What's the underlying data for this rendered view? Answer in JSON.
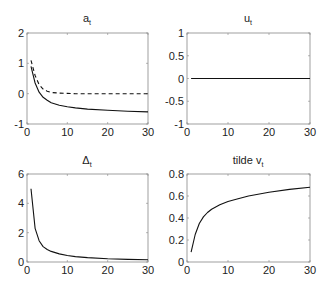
{
  "chart_data": [
    {
      "type": "line",
      "title": "a_t",
      "title_main": "a",
      "title_sub": "t",
      "xlabel": "",
      "ylabel": "",
      "xlim": [
        0,
        30
      ],
      "ylim": [
        -1,
        2
      ],
      "xticks": [
        0,
        10,
        20,
        30
      ],
      "yticks": [
        -1,
        0,
        1,
        2
      ],
      "x": [
        1,
        2,
        3,
        4,
        5,
        6,
        8,
        10,
        12,
        15,
        20,
        25,
        30
      ],
      "series": [
        {
          "name": "solid",
          "style": "solid",
          "values": [
            0.9,
            0.35,
            0.05,
            -0.12,
            -0.22,
            -0.3,
            -0.38,
            -0.43,
            -0.47,
            -0.51,
            -0.55,
            -0.58,
            -0.6
          ]
        },
        {
          "name": "dashed",
          "style": "dashed",
          "values": [
            1.1,
            0.6,
            0.3,
            0.15,
            0.08,
            0.04,
            0.02,
            0.01,
            0.0,
            0.0,
            0.0,
            0.0,
            0.0
          ]
        }
      ]
    },
    {
      "type": "line",
      "title": "u_t",
      "title_main": "u",
      "title_sub": "t",
      "xlim": [
        0,
        30
      ],
      "ylim": [
        -1,
        1
      ],
      "xticks": [
        0,
        10,
        20,
        30
      ],
      "yticks": [
        -1,
        -0.5,
        0,
        0.5,
        1
      ],
      "x": [
        1,
        30
      ],
      "series": [
        {
          "name": "solid",
          "style": "solid",
          "values": [
            0,
            0
          ]
        }
      ]
    },
    {
      "type": "line",
      "title": "Δ_t",
      "title_main": "Δ",
      "title_sub": "t",
      "xlim": [
        0,
        30
      ],
      "ylim": [
        0,
        6
      ],
      "xticks": [
        0,
        10,
        20,
        30
      ],
      "yticks": [
        0,
        2,
        4,
        6
      ],
      "x": [
        1,
        2,
        3,
        4,
        5,
        6,
        8,
        10,
        12,
        15,
        20,
        25,
        30
      ],
      "series": [
        {
          "name": "solid",
          "style": "solid",
          "values": [
            5.0,
            2.3,
            1.45,
            1.05,
            0.85,
            0.72,
            0.55,
            0.44,
            0.37,
            0.3,
            0.22,
            0.18,
            0.15
          ]
        }
      ]
    },
    {
      "type": "line",
      "title": "tilde v_t",
      "title_main": "tilde v",
      "title_sub": "t",
      "xlim": [
        0,
        30
      ],
      "ylim": [
        0,
        0.8
      ],
      "xticks": [
        0,
        10,
        20,
        30
      ],
      "yticks": [
        0,
        0.2,
        0.4,
        0.6,
        0.8
      ],
      "x": [
        1,
        2,
        3,
        4,
        5,
        6,
        8,
        10,
        12,
        15,
        20,
        25,
        30
      ],
      "series": [
        {
          "name": "solid",
          "style": "solid",
          "values": [
            0.09,
            0.25,
            0.35,
            0.41,
            0.45,
            0.48,
            0.52,
            0.55,
            0.57,
            0.6,
            0.635,
            0.66,
            0.68
          ]
        }
      ]
    }
  ],
  "panels": {
    "a": {
      "title_main": "a",
      "title_sub": "t"
    },
    "u": {
      "title_main": "u",
      "title_sub": "t"
    },
    "delta": {
      "title_main": "Δ",
      "title_sub": "t"
    },
    "v": {
      "title_main": "tilde v",
      "title_sub": "t"
    }
  }
}
